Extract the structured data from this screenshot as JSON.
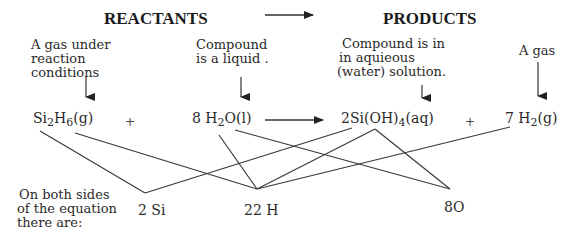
{
  "headers": {
    "reactants": "REACTANTS",
    "products": "PRODUCTS"
  },
  "notes": {
    "si2h6": [
      "A gas under",
      "reaction",
      "conditions"
    ],
    "h2o": [
      "Compound",
      "is a liquid ."
    ],
    "sioh4": [
      "Compound is in",
      "in aquieous",
      "(water) solution."
    ],
    "h2": [
      "A gas"
    ]
  },
  "equation": {
    "reactant1": {
      "a": "Si",
      "s1": "2",
      "b": "H",
      "s2": "6",
      "c": "(g)"
    },
    "plus1": "+",
    "reactant2": {
      "a": "8 H",
      "s1": "2",
      "b": "O(l)"
    },
    "product1": {
      "a": "2Si(OH)",
      "s1": "4",
      "b": "(aq)"
    },
    "plus2": "+",
    "product2": {
      "a": "7 H",
      "s1": "2",
      "b": "(g)"
    }
  },
  "summary": {
    "lines": [
      "On both sides",
      "of the equation",
      "there are:"
    ],
    "si_count": "2 Si",
    "h_count": "22 H",
    "o_count": "8O"
  }
}
